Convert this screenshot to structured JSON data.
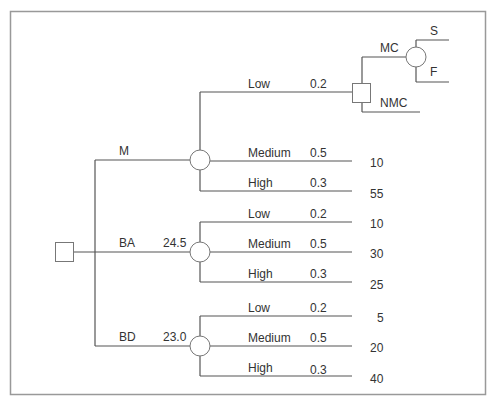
{
  "diagram": {
    "type": "decision-tree",
    "root": {
      "kind": "decision",
      "shape": "square"
    },
    "alternatives": [
      {
        "label": "M",
        "value": "",
        "chance_node": {
          "branches": [
            {
              "label": "Low",
              "prob": "0.2",
              "payoff": "",
              "leads_to": "decision-MC-NMC"
            },
            {
              "label": "Medium",
              "prob": "0.5",
              "payoff": "10"
            },
            {
              "label": "High",
              "prob": "0.3",
              "payoff": "55"
            }
          ]
        }
      },
      {
        "label": "BA",
        "value": "24.5",
        "chance_node": {
          "branches": [
            {
              "label": "Low",
              "prob": "0.2",
              "payoff": "10"
            },
            {
              "label": "Medium",
              "prob": "0.5",
              "payoff": "30"
            },
            {
              "label": "High",
              "prob": "0.3",
              "payoff": "25"
            }
          ]
        }
      },
      {
        "label": "BD",
        "value": "23.0",
        "chance_node": {
          "branches": [
            {
              "label": "Low",
              "prob": "0.2",
              "payoff": "5"
            },
            {
              "label": "Medium",
              "prob": "0.5",
              "payoff": "20"
            },
            {
              "label": "High",
              "prob": "0.3",
              "payoff": "40"
            }
          ]
        }
      }
    ],
    "sub_decision": {
      "options": [
        {
          "label": "MC",
          "chance_outcomes": [
            {
              "label": "S"
            },
            {
              "label": "F"
            }
          ]
        },
        {
          "label": "NMC"
        }
      ]
    }
  }
}
